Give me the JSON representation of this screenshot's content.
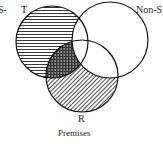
{
  "diagram": {
    "type": "venn",
    "caption": "Premises",
    "sets": [
      {
        "label": "T",
        "cx": 52,
        "cy": 42,
        "r": 36,
        "shading": "horizontal-lines"
      },
      {
        "label": "Non-S",
        "cx": 110,
        "cy": 40,
        "r": 38,
        "shading": "none"
      },
      {
        "label": "R",
        "cx": 82,
        "cy": 76,
        "r": 36,
        "shading": "diagonal-lines"
      }
    ],
    "overlap_shading": {
      "sets": [
        "T",
        "R"
      ],
      "excluding": [
        "Non-S"
      ],
      "pattern": "cross-hatch"
    },
    "edge_fragment": "S-"
  }
}
